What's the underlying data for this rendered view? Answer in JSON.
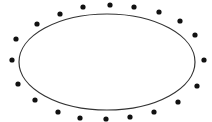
{
  "diagram": {
    "background": "#ffffff",
    "ellipse": {
      "cx": 107,
      "cy": 62,
      "rx": 88,
      "ry": 48,
      "stroke": "#333333",
      "stroke_width": 1.2,
      "fill": "none"
    },
    "dot_color": "#111111",
    "dot_radius": 2.6,
    "dots": [
      [
        83,
        7
      ],
      [
        110,
        5
      ],
      [
        134,
        7
      ],
      [
        159,
        12
      ],
      [
        180,
        21
      ],
      [
        195,
        35
      ],
      [
        204,
        60
      ],
      [
        197,
        86
      ],
      [
        178,
        102
      ],
      [
        154,
        112
      ],
      [
        130,
        117
      ],
      [
        106,
        119
      ],
      [
        80,
        118
      ],
      [
        58,
        112
      ],
      [
        35,
        100
      ],
      [
        18,
        84
      ],
      [
        12,
        60
      ],
      [
        16,
        39
      ],
      [
        37,
        24
      ],
      [
        60,
        14
      ]
    ]
  }
}
